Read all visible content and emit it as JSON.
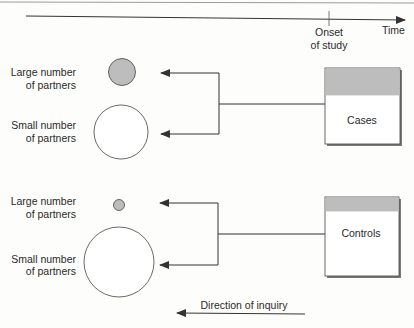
{
  "timeline": {
    "axis_label": "Time",
    "onset_line1": "Onset",
    "onset_line2": "of study"
  },
  "cases_group": {
    "box_label": "Cases",
    "large_label_line1": "Large number",
    "large_label_line2": "of partners",
    "small_label_line1": "Small number",
    "small_label_line2": "of partners"
  },
  "controls_group": {
    "box_label": "Controls",
    "large_label_line1": "Large number",
    "large_label_line2": "of partners",
    "small_label_line1": "Small number",
    "small_label_line2": "of partners"
  },
  "footer": {
    "direction_label": "Direction of inquiry"
  },
  "colors": {
    "line": "#333333",
    "fill_gray": "#bdbdbd",
    "box_shadow": "#7a7a7a"
  }
}
